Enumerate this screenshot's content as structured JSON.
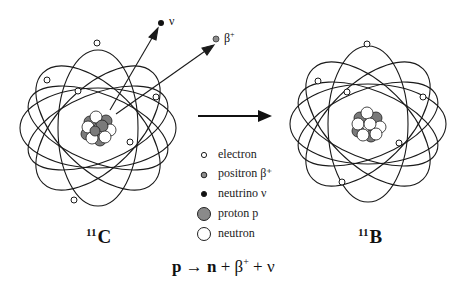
{
  "diagram": {
    "left_atom": {
      "label_mass": "11",
      "label_symbol": "C"
    },
    "right_atom": {
      "label_mass": "11",
      "label_symbol": "B"
    },
    "emitted": {
      "neutrino_label": "ν",
      "positron_label_base": "β",
      "positron_label_sup": "+"
    },
    "legend": [
      {
        "symbol": "electron-small-open",
        "label": "electron"
      },
      {
        "symbol": "positron-small-grey",
        "label": "positron β⁺"
      },
      {
        "symbol": "neutrino-small-black",
        "label": "neutrino ν"
      },
      {
        "symbol": "proton-large-grey",
        "label": "proton p"
      },
      {
        "symbol": "neutron-large-open",
        "label": "neutron"
      }
    ],
    "equation": {
      "p": "p",
      "arrow": "→",
      "n": "n",
      "plus1": "+",
      "beta": "β",
      "beta_sup": "+",
      "plus2": "+",
      "nu": "ν"
    },
    "colors": {
      "proton": "#7a7a7a",
      "neutron": "#ffffff",
      "line": "#1a1a1a",
      "positron": "#8c8c8c"
    }
  }
}
